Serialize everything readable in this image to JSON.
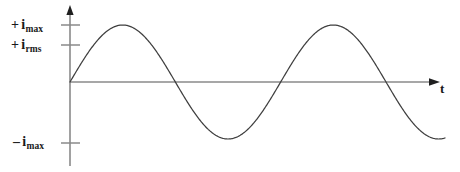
{
  "figure": {
    "name": "ac-sinusoidal-current-waveform",
    "background_color": "#ffffff",
    "line_color": "#3f3f3f",
    "axis_color": "#8a8a8a",
    "text_color": "#1a1a1a"
  },
  "labels": {
    "imax_pos": {
      "sign": "+",
      "symbol": "i",
      "subscript": "max"
    },
    "irms_pos": {
      "sign": "+",
      "symbol": "i",
      "subscript": "rms"
    },
    "imax_neg": {
      "sign": "–",
      "symbol": "i",
      "subscript": "max"
    },
    "time_axis": "t"
  },
  "chart_data": {
    "type": "line",
    "title": "",
    "xlabel": "t",
    "ylabel": "",
    "grid": false,
    "legend": null,
    "x_axis": {
      "origin_px": 70,
      "end_px": 438,
      "baseline_px": 82,
      "arrow": true,
      "tick_labels": [],
      "label": "t"
    },
    "y_axis": {
      "axis_px": 70,
      "top_px": 8,
      "bottom_px": 166,
      "arrow": true,
      "ticks": [
        {
          "label": "+ imax",
          "value": 1.0,
          "y_px": 25
        },
        {
          "label": "+ irms",
          "value": 0.707,
          "y_px": 45
        },
        {
          "label": "- imax",
          "value": -1.0,
          "y_px": 143
        }
      ],
      "ylim": [
        -1.15,
        1.15
      ]
    },
    "series": [
      {
        "name": "instantaneous current",
        "function": "i = imax * sin(2*pi*t/T)",
        "amplitude": 1.0,
        "periods_shown": 1.78,
        "x": [
          0.0,
          0.0625,
          0.125,
          0.1875,
          0.25,
          0.3125,
          0.375,
          0.4375,
          0.5,
          0.5625,
          0.625,
          0.6875,
          0.75,
          0.8125,
          0.875,
          0.9375,
          1.0,
          1.0625,
          1.125,
          1.1875,
          1.25,
          1.3125,
          1.375,
          1.4375,
          1.5,
          1.5625,
          1.625,
          1.6875,
          1.75,
          1.78
        ],
        "values": [
          0.0,
          0.383,
          0.707,
          0.924,
          1.0,
          0.924,
          0.707,
          0.383,
          0.0,
          -0.383,
          -0.707,
          -0.924,
          -1.0,
          -0.924,
          -0.707,
          -0.383,
          0.0,
          0.383,
          0.707,
          0.924,
          1.0,
          0.924,
          0.707,
          0.383,
          0.0,
          -0.383,
          -0.707,
          -0.924,
          -1.0,
          -0.995
        ]
      }
    ],
    "annotations": []
  }
}
